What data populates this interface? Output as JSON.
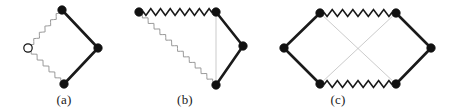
{
  "figure": {
    "background_color": "#ffffff",
    "bond_color_solid": "#1a1a1a",
    "bond_color_zigzag": "#1a1a1a",
    "bond_color_thin_gray": "#b4b4b4",
    "zigzag_gray_color": "#9a9a9a",
    "vertex_fill_color": "#111111",
    "vertex_hollow_fill": "#ffffff",
    "vertex_stroke_color": "#111111",
    "vertex_radius": 4.2,
    "solid_bond_width": 2.6,
    "zigzag_bond_width": 1.6,
    "thin_bond_width": 0.7
  },
  "panels": [
    {
      "id": "a",
      "label": "(a)",
      "shape": "diamond",
      "vertices": [
        {
          "name": "top",
          "x": 62,
          "y": 10,
          "style": "filled"
        },
        {
          "name": "right",
          "x": 98,
          "y": 48,
          "style": "filled"
        },
        {
          "name": "bottom",
          "x": 64,
          "y": 84,
          "style": "filled"
        },
        {
          "name": "left",
          "x": 28,
          "y": 48,
          "style": "hollow"
        }
      ],
      "edges": [
        {
          "from": "top",
          "to": "right",
          "style": "solid"
        },
        {
          "from": "right",
          "to": "bottom",
          "style": "solid"
        },
        {
          "from": "bottom",
          "to": "left",
          "style": "zigzag-gray"
        },
        {
          "from": "left",
          "to": "top",
          "style": "zigzag-gray"
        }
      ]
    },
    {
      "id": "b",
      "label": "(b)",
      "shape": "tilted-square",
      "vertices": [
        {
          "name": "top-left",
          "x": 139,
          "y": 12,
          "style": "filled"
        },
        {
          "name": "top-right",
          "x": 216,
          "y": 12,
          "style": "filled"
        },
        {
          "name": "right",
          "x": 243,
          "y": 46,
          "style": "filled"
        },
        {
          "name": "bottom",
          "x": 216,
          "y": 85,
          "style": "filled"
        }
      ],
      "edges": [
        {
          "from": "top-left",
          "to": "top-right",
          "style": "zigzag-black"
        },
        {
          "from": "top-right",
          "to": "right",
          "style": "solid"
        },
        {
          "from": "right",
          "to": "bottom",
          "style": "solid"
        },
        {
          "from": "bottom",
          "to": "top-left",
          "style": "zigzag-gray"
        },
        {
          "from": "top-right",
          "to": "bottom",
          "style": "thin-gray"
        }
      ]
    },
    {
      "id": "c",
      "label": "(c)",
      "shape": "hexagon-double-diamond",
      "vertices": [
        {
          "name": "top-left",
          "x": 320,
          "y": 13,
          "style": "filled"
        },
        {
          "name": "top-right",
          "x": 396,
          "y": 13,
          "style": "filled"
        },
        {
          "name": "right",
          "x": 431,
          "y": 48,
          "style": "filled"
        },
        {
          "name": "bottom-right",
          "x": 396,
          "y": 84,
          "style": "filled"
        },
        {
          "name": "bottom-left",
          "x": 320,
          "y": 84,
          "style": "filled"
        },
        {
          "name": "left",
          "x": 284,
          "y": 48,
          "style": "filled"
        }
      ],
      "edges": [
        {
          "from": "top-left",
          "to": "top-right",
          "style": "zigzag-black"
        },
        {
          "from": "top-right",
          "to": "right",
          "style": "solid"
        },
        {
          "from": "right",
          "to": "bottom-right",
          "style": "solid"
        },
        {
          "from": "bottom-right",
          "to": "bottom-left",
          "style": "zigzag-black"
        },
        {
          "from": "bottom-left",
          "to": "left",
          "style": "solid"
        },
        {
          "from": "left",
          "to": "top-left",
          "style": "solid"
        },
        {
          "from": "top-left",
          "to": "bottom-right",
          "style": "thin-gray"
        },
        {
          "from": "top-right",
          "to": "bottom-left",
          "style": "thin-gray"
        }
      ]
    }
  ]
}
